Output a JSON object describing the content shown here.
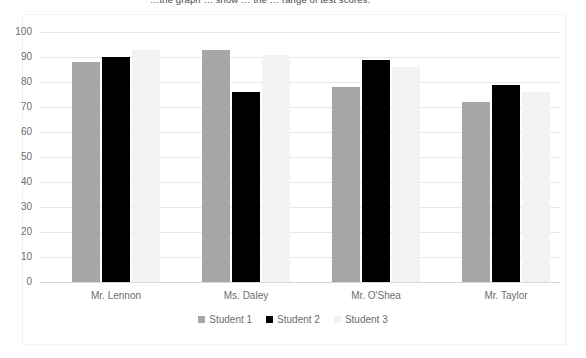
{
  "caption": {
    "text": "…the graph … show … the … range of test scores."
  },
  "chart_data": {
    "type": "bar",
    "title": "",
    "subtitle": "",
    "xlabel": "",
    "ylabel": "",
    "ylim": [
      0,
      100
    ],
    "ytick_step": 10,
    "yticks": [
      "100",
      "90",
      "80",
      "70",
      "60",
      "50",
      "40",
      "30",
      "20",
      "10",
      "0"
    ],
    "grid": true,
    "legend_position": "bottom",
    "categories": [
      "Mr. Lennon",
      "Ms. Daley",
      "Mr. O'Shea",
      "Mr. Taylor"
    ],
    "series": [
      {
        "name": "Student 1",
        "color": "#a6a6a6",
        "values": [
          88,
          93,
          78,
          72
        ]
      },
      {
        "name": "Student 2",
        "color": "#000000",
        "values": [
          90,
          76,
          89,
          79
        ]
      },
      {
        "name": "Student 3",
        "color": "#f2f2f2",
        "values": [
          93,
          91,
          86,
          76
        ]
      }
    ]
  }
}
